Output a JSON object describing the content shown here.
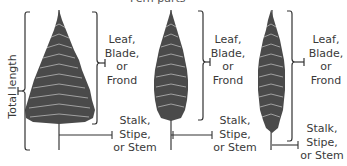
{
  "title_partial": "Fern parts",
  "total_length_label": "Total length",
  "ferns": [
    {
      "blade_label": [
        "Leaf,",
        "Blade,",
        "or",
        "Frond"
      ],
      "stipe_label": [
        "Stalk,",
        "Stipe,",
        "or Stem"
      ]
    },
    {
      "blade_label": [
        "Leaf,",
        "Blade,",
        "or",
        "Frond"
      ],
      "stipe_label": [
        "Stalk,",
        "Stipe,",
        "or Stem"
      ]
    },
    {
      "blade_label": [
        "Leaf,",
        "Blade,",
        "or",
        "Frond"
      ],
      "stipe_label": [
        "Stalk,",
        "Stipe,",
        "or Stem"
      ]
    }
  ],
  "colors": {
    "fern": "#3a3a3a",
    "bracket": "#333333",
    "text": "#3a3a3a"
  }
}
